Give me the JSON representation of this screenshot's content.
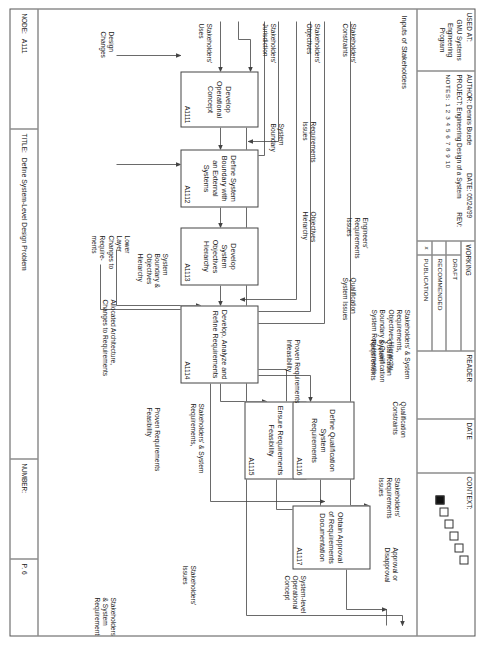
{
  "header": {
    "used_at_label": "USED AT:",
    "used_at_value": "GMU Systems\nEngineering\nProgram",
    "author_label": "AUTHOR:",
    "author_value": "Dennis Buede",
    "date_label": "DATE:",
    "date_value": "05/24/99",
    "project_label": "PROJECT:",
    "project_value": "Engineering Design of a System",
    "rev_label": "REV:",
    "rev_value": "",
    "notes_label": "NOTES:",
    "notes_value": "1  2  3  4  5  6  7  8  9  10",
    "working_label": "WORKING",
    "status_rows": [
      {
        "mark": "",
        "label": "DRAFT"
      },
      {
        "mark": "",
        "label": "RECOMMENDED"
      },
      {
        "mark": "x",
        "label": "PUBLICATION"
      }
    ],
    "reader_label": "READER",
    "date_col_label": "DATE",
    "context_label": "CONTEXT:"
  },
  "footer": {
    "node_label": "NODE:",
    "node_value": "A111",
    "title_label": "TITLE:",
    "title_value": "Define System-Level Design Problem",
    "number_label": "NUMBER:",
    "number_value": "P. 6"
  },
  "diagram": {
    "caption": "Inputs of Stakeholders",
    "boxes": [
      {
        "id": "a1111",
        "title": "Develop\nOperational\nConcept",
        "code": "A1111"
      },
      {
        "id": "a1112",
        "title": "Define\nSystem\nBoundary\nwith an\nExternal\nSystems",
        "code": "A1112"
      },
      {
        "id": "a1113",
        "title": "Develop\nSystem\nObjectives\nHierarchy",
        "code": "A1113"
      },
      {
        "id": "a1114",
        "title": "Develop,\nAnalyze and\nRefine\nRequirements",
        "code": "A1114"
      },
      {
        "id": "a1115",
        "title": "Ensure\nRequirements\nFeasibility",
        "code": "A1115"
      },
      {
        "id": "a1116",
        "title": "Define\nQualification\nSystem\nRequirements",
        "code": "A1116"
      },
      {
        "id": "a1117",
        "title": "Obtain\nApproval of\nRequirements\nDocumentation",
        "code": "A1117"
      }
    ],
    "labels": {
      "stakeholders_uses": "Stakeholders'\nUses",
      "stakeholders_jurisdiction": "Stakeholders'\nJurisdiction",
      "stakeholders_objectives": "Stakeholders'\nObjectives",
      "stakeholders_constraints": "Stakeholders'\nConstraints",
      "design_changes": "Design\nChanges",
      "lower_layer_changes": "Lower\nLayer\nChanges to\nRequire-\nments",
      "allocated_architecture": "Allocated Architecture,\nChanges to Requirements",
      "requirements_issues": "Requirements\nIssues",
      "system_boundary": "System\nBoundary",
      "objectives_hierarchy": "Objectives\nHierarchy",
      "engineers_requirements_issues": "Engineers'\nRequirements\nIssues",
      "qualification_system_issues": "Qualification\nSystem Issues",
      "qualification_system_requirements": "Qualification\nSystem\nRequirements",
      "qualification_constraints": "Qualification\nConstraints",
      "system_boundary_objectives_hierarchy": "System\nBoundary &\nObjectives\nHierarchy",
      "proven_requirements_infeasibility": "Proven Requirements\nInfeasibility",
      "proven_requirements_feasibility": "Proven Requirements\nFeasibility",
      "stakeholders_system_requirements_in": "Stakeholders' & System\nRequirements,",
      "stakeholders_requirements_issues": "Stakeholders'\nRequirements\nIssues",
      "approval_or_disapproval": "Approval or\nDisapproval",
      "system_level_operational_concept": "System-level\nOperational\nConcept",
      "stakeholders_system_req_obj_bound": "Stakeholders' & System\nRequirements,\nObjectives Hierarchy,\nBoundary & Qualification\nSystem Requirements",
      "stakeholders_issues": "Stakeholders'\nIssues",
      "stakeholders_system_requirements_out": "Stakeholders'\n& System\nRequirements"
    }
  },
  "colors": {
    "line": "#444444",
    "border": "#555555",
    "text": "#1a1a1a",
    "background": "#ffffff"
  }
}
